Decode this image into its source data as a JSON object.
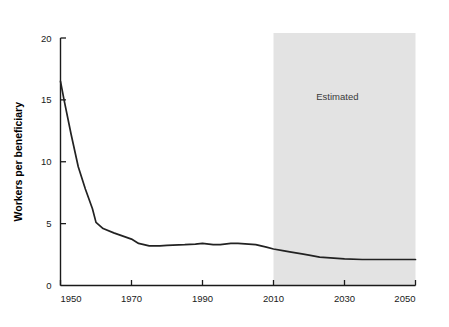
{
  "chart_data": {
    "type": "line",
    "title": "",
    "xlabel": "",
    "ylabel": "Workers per beneficiary",
    "xlim": [
      1950,
      2050
    ],
    "ylim": [
      0,
      20
    ],
    "xticks": [
      1950,
      1970,
      1990,
      2010,
      2030,
      2050
    ],
    "xtick_labels": [
      "1950",
      "1970",
      "1990",
      "2010",
      "2030",
      "2050"
    ],
    "yticks": [
      0,
      5,
      10,
      15,
      20
    ],
    "ytick_labels": [
      "0",
      "5",
      "10",
      "15",
      "20"
    ],
    "grid": false,
    "legend": "none",
    "line_color": "#222222",
    "background_color": "#ffffff",
    "series": [
      {
        "name": "Workers per beneficiary",
        "x": [
          1950,
          1951,
          1953,
          1955,
          1957,
          1959,
          1960,
          1962,
          1965,
          1967,
          1970,
          1972,
          1975,
          1978,
          1980,
          1985,
          1988,
          1990,
          1993,
          1995,
          1998,
          2000,
          2003,
          2005,
          2008,
          2010,
          2013,
          2015,
          2018,
          2020,
          2023,
          2025,
          2030,
          2035,
          2040,
          2045,
          2050
        ],
        "y": [
          16.5,
          15.0,
          12.2,
          9.6,
          7.8,
          6.2,
          5.1,
          4.6,
          4.25,
          4.05,
          3.75,
          3.4,
          3.2,
          3.2,
          3.25,
          3.3,
          3.35,
          3.4,
          3.3,
          3.3,
          3.4,
          3.4,
          3.35,
          3.3,
          3.1,
          2.95,
          2.8,
          2.7,
          2.55,
          2.45,
          2.3,
          2.25,
          2.15,
          2.1,
          2.1,
          2.1,
          2.1
        ]
      }
    ],
    "annotations": [
      {
        "name": "estimated-region",
        "label": "Estimated",
        "x_start": 2010,
        "x_end": 2050,
        "fill": "#e3e3e3",
        "label_x": 2028,
        "label_y": 15.0
      }
    ]
  }
}
